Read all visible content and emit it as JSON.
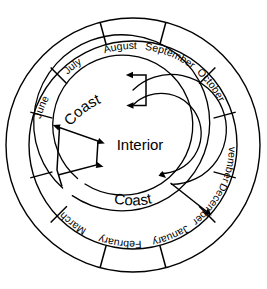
{
  "diagram": {
    "type": "circular-annual-cycle",
    "center": {
      "x": 133,
      "y": 145
    },
    "colors": {
      "stroke": "#000000",
      "background": "#ffffff",
      "text": "#000000"
    },
    "radii": {
      "outer_ring_outer": 127,
      "outer_ring_inner": 104,
      "coast_arc_outer": 88,
      "coast_arc_inner": 70,
      "interior_arc_outer": 55,
      "interior_arc_inner": 40
    },
    "months": [
      {
        "name": "June",
        "index": 0,
        "start_angle": -105,
        "end_angle": -75,
        "flipped": false
      },
      {
        "name": "July",
        "index": 1,
        "start_angle": -75,
        "end_angle": -45,
        "flipped": false
      },
      {
        "name": "August",
        "index": 2,
        "start_angle": -45,
        "end_angle": -15,
        "flipped": false
      },
      {
        "name": "September",
        "index": 3,
        "start_angle": -15,
        "end_angle": 15,
        "flipped": false
      },
      {
        "name": "October",
        "index": 4,
        "start_angle": 15,
        "end_angle": 45,
        "flipped": false
      },
      {
        "name": "November",
        "index": 5,
        "start_angle": 45,
        "end_angle": 75,
        "flipped": true
      },
      {
        "name": "December",
        "index": 6,
        "start_angle": 75,
        "end_angle": 105,
        "flipped": true
      },
      {
        "name": "January",
        "index": 7,
        "start_angle": 105,
        "end_angle": 135,
        "flipped": true
      },
      {
        "name": "February",
        "index": 8,
        "start_angle": 135,
        "end_angle": 165,
        "flipped": true
      },
      {
        "name": "March",
        "index": 9,
        "start_angle": 165,
        "end_angle": 195,
        "flipped": true
      },
      {
        "name": "April",
        "index": 10,
        "start_angle": 195,
        "end_angle": 225,
        "flipped": false
      },
      {
        "name": "May",
        "index": 11,
        "start_angle": 225,
        "end_angle": 255,
        "flipped": false
      }
    ],
    "zones": [
      {
        "label": "Coast",
        "position": "upper-arc",
        "id": "coast-upper"
      },
      {
        "label": "Coast",
        "position": "lower-arc",
        "id": "coast-lower"
      },
      {
        "label": "Interior",
        "position": "center",
        "id": "interior"
      }
    ],
    "connectors": [
      {
        "id": "connector-top",
        "description": "vertical double-arrow linking coast arc to interior arc at top"
      },
      {
        "id": "connector-left",
        "description": "zigzag double-arrow linking arcs on the left"
      },
      {
        "id": "connector-right",
        "description": "diagonal arrow linking interior arc outward to coast arc on the lower right"
      }
    ]
  }
}
